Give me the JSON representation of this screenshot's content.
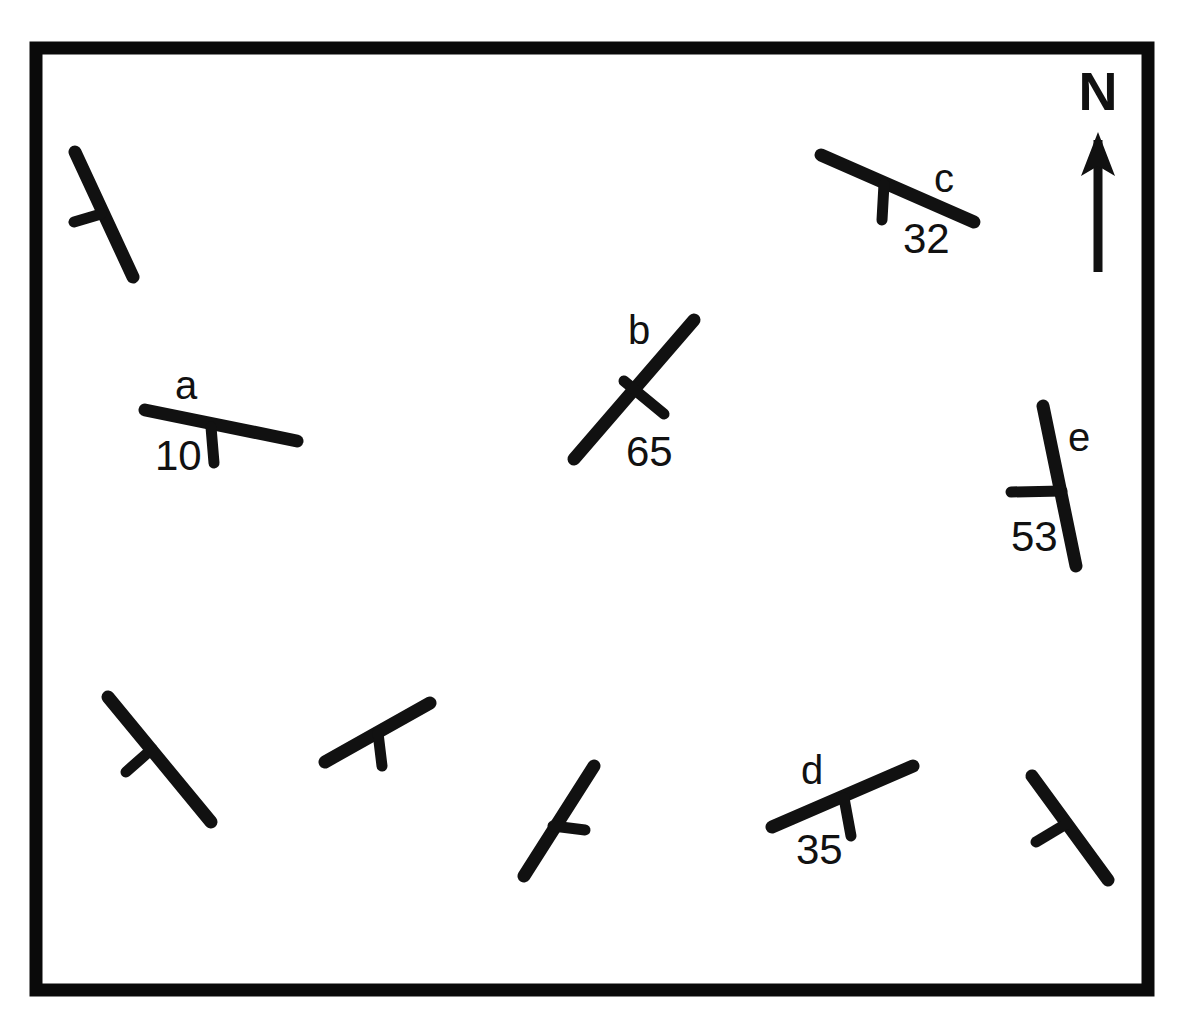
{
  "figure": {
    "name": "geologic-strike-and-dip-map",
    "background_color": "#ffffff",
    "ink_color": "#111111",
    "frame": {
      "stroke_color": "#0a0a0a",
      "stroke_width": 13,
      "x": 36,
      "y": 48,
      "width": 1112,
      "height": 942
    }
  },
  "north_arrow": {
    "label": "N",
    "label_x": 1098,
    "label_y": 110,
    "shaft_x": 1098,
    "shaft_top": 140,
    "shaft_bottom": 272,
    "head_points": "1098,132 1081,176 1098,166 1115,176"
  },
  "symbols": [
    {
      "id": "sym-a",
      "label": "a",
      "dip": "10",
      "strike": {
        "x1": 145,
        "y1": 410,
        "x2": 297,
        "y2": 441,
        "width": 13
      },
      "tick": {
        "x1": 211,
        "y1": 427,
        "x2": 214,
        "y2": 463,
        "width": 11
      },
      "label_x": 186,
      "label_y": 399,
      "dip_x": 155,
      "dip_y": 470
    },
    {
      "id": "sym-b",
      "label": "b",
      "dip": "65",
      "strike": {
        "x1": 574,
        "y1": 459,
        "x2": 694,
        "y2": 320,
        "width": 13
      },
      "tick": {
        "x1": 624,
        "y1": 381,
        "x2": 664,
        "y2": 414,
        "width": 11
      },
      "label_x": 639,
      "label_y": 344,
      "dip_x": 626,
      "dip_y": 466
    },
    {
      "id": "sym-c",
      "label": "c",
      "dip": "32",
      "strike": {
        "x1": 821,
        "y1": 155,
        "x2": 974,
        "y2": 222,
        "width": 13
      },
      "tick": {
        "x1": 884,
        "y1": 184,
        "x2": 882,
        "y2": 220,
        "width": 11
      },
      "label_x": 944,
      "label_y": 192,
      "dip_x": 903,
      "dip_y": 253
    },
    {
      "id": "sym-d",
      "label": "d",
      "dip": "35",
      "strike": {
        "x1": 772,
        "y1": 827,
        "x2": 913,
        "y2": 766,
        "width": 13
      },
      "tick": {
        "x1": 844,
        "y1": 798,
        "x2": 851,
        "y2": 836,
        "width": 11
      },
      "label_x": 812,
      "label_y": 784,
      "dip_x": 796,
      "dip_y": 864
    },
    {
      "id": "sym-e",
      "label": "e",
      "dip": "53",
      "strike": {
        "x1": 1043,
        "y1": 406,
        "x2": 1076,
        "y2": 566,
        "width": 13
      },
      "tick": {
        "x1": 1062,
        "y1": 491,
        "x2": 1011,
        "y2": 492,
        "width": 11
      },
      "label_x": 1079,
      "label_y": 451,
      "dip_x": 1011,
      "dip_y": 551
    }
  ],
  "unlabeled_symbols": [
    {
      "id": "sym-u1",
      "strike": {
        "x1": 75,
        "y1": 152,
        "x2": 133,
        "y2": 277,
        "width": 13
      },
      "tick": {
        "x1": 101,
        "y1": 214,
        "x2": 74,
        "y2": 222,
        "width": 11
      }
    },
    {
      "id": "sym-u2",
      "strike": {
        "x1": 108,
        "y1": 697,
        "x2": 211,
        "y2": 822,
        "width": 13
      },
      "tick": {
        "x1": 152,
        "y1": 749,
        "x2": 126,
        "y2": 772,
        "width": 11
      }
    },
    {
      "id": "sym-u3",
      "strike": {
        "x1": 325,
        "y1": 762,
        "x2": 430,
        "y2": 703,
        "width": 13
      },
      "tick": {
        "x1": 378,
        "y1": 733,
        "x2": 382,
        "y2": 766,
        "width": 11
      }
    },
    {
      "id": "sym-u4",
      "strike": {
        "x1": 524,
        "y1": 876,
        "x2": 594,
        "y2": 766,
        "width": 13
      },
      "tick": {
        "x1": 553,
        "y1": 826,
        "x2": 585,
        "y2": 830,
        "width": 11
      }
    },
    {
      "id": "sym-u5",
      "strike": {
        "x1": 1032,
        "y1": 776,
        "x2": 1108,
        "y2": 880,
        "width": 13
      },
      "tick": {
        "x1": 1066,
        "y1": 824,
        "x2": 1036,
        "y2": 842,
        "width": 11
      }
    }
  ]
}
